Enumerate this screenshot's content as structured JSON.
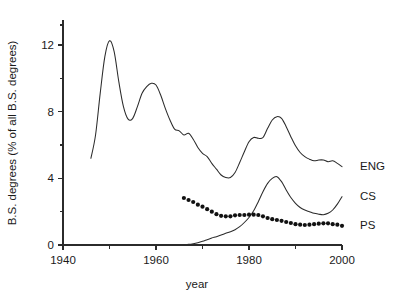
{
  "chart_data": {
    "type": "line",
    "title": "",
    "xlabel": "year",
    "ylabel": "B.S. degrees (% of all B.S. degrees)",
    "xlim": [
      1940,
      2000
    ],
    "ylim": [
      0,
      13.5
    ],
    "grid": false,
    "legend_position": "right-of-axes-inline",
    "x_ticks_major": [
      1940,
      1960,
      1980,
      2000
    ],
    "x_ticks_major_labels": [
      "1940",
      "1960",
      "1980",
      "2000"
    ],
    "x_ticks_minor": [
      1950,
      1970,
      1990
    ],
    "y_ticks_major": [
      0,
      4,
      8,
      12
    ],
    "y_ticks_major_labels": [
      "0",
      "4",
      "8",
      "12"
    ],
    "y_ticks_minor": [
      2,
      6,
      10
    ],
    "series": [
      {
        "name": "ENG",
        "label": "ENG",
        "style": "line",
        "x": [
          1946,
          1947,
          1948,
          1949,
          1950,
          1951,
          1952,
          1953,
          1954,
          1955,
          1956,
          1957,
          1958,
          1959,
          1960,
          1961,
          1962,
          1963,
          1964,
          1965,
          1966,
          1967,
          1968,
          1969,
          1970,
          1971,
          1972,
          1973,
          1974,
          1975,
          1976,
          1977,
          1978,
          1979,
          1980,
          1981,
          1982,
          1983,
          1984,
          1985,
          1986,
          1987,
          1988,
          1989,
          1990,
          1991,
          1992,
          1993,
          1994,
          1995,
          1996,
          1997,
          1998,
          1999,
          2000
        ],
        "y": [
          5.2,
          6.6,
          9.1,
          11.3,
          12.25,
          11.6,
          9.8,
          8.3,
          7.55,
          7.6,
          8.3,
          9.1,
          9.5,
          9.7,
          9.6,
          9.0,
          8.2,
          7.5,
          6.95,
          6.85,
          6.6,
          6.7,
          6.35,
          5.85,
          5.5,
          5.3,
          4.9,
          4.55,
          4.2,
          4.05,
          4.05,
          4.35,
          4.95,
          5.6,
          6.2,
          6.45,
          6.4,
          6.45,
          7.0,
          7.5,
          7.7,
          7.6,
          7.1,
          6.5,
          5.95,
          5.55,
          5.3,
          5.15,
          5.05,
          5.1,
          5.1,
          5.0,
          5.05,
          4.9,
          4.7
        ],
        "notes": "Starts 1946 at ~5.2; peak ~12.2 in 1950; secondary peak ~9.7 in 1959; trough ~4.0 in 1975-76; second peak ~7.7 in 1986; ends ~4.7 in 2000"
      },
      {
        "name": "CS",
        "label": "CS",
        "style": "line",
        "x": [
          1966,
          1967,
          1968,
          1969,
          1970,
          1971,
          1972,
          1973,
          1974,
          1975,
          1976,
          1977,
          1978,
          1979,
          1980,
          1981,
          1982,
          1983,
          1984,
          1985,
          1986,
          1987,
          1988,
          1989,
          1990,
          1991,
          1992,
          1993,
          1994,
          1995,
          1996,
          1997,
          1998,
          1999,
          2000
        ],
        "y": [
          0.02,
          0.04,
          0.08,
          0.14,
          0.22,
          0.32,
          0.42,
          0.5,
          0.6,
          0.7,
          0.8,
          0.92,
          1.1,
          1.35,
          1.65,
          2.05,
          2.6,
          3.2,
          3.7,
          4.0,
          4.1,
          3.8,
          3.3,
          2.85,
          2.5,
          2.25,
          2.1,
          2.0,
          1.9,
          1.85,
          1.82,
          1.9,
          2.1,
          2.45,
          2.9
        ],
        "notes": "Begins near 0 around 1966; slow rise through 1970s; sharp climb to peak ~4.1 in 1986; decline to ~1.8 by 1996; rebound to ~2.9 at 2000"
      },
      {
        "name": "PS",
        "label": "PS",
        "style": "dots",
        "x": [
          1966,
          1967,
          1968,
          1969,
          1970,
          1971,
          1972,
          1973,
          1974,
          1975,
          1976,
          1977,
          1978,
          1979,
          1980,
          1981,
          1982,
          1983,
          1984,
          1985,
          1986,
          1987,
          1988,
          1989,
          1990,
          1991,
          1992,
          1993,
          1994,
          1995,
          1996,
          1997,
          1998,
          1999,
          2000
        ],
        "y": [
          2.82,
          2.7,
          2.58,
          2.42,
          2.3,
          2.15,
          2.0,
          1.85,
          1.75,
          1.72,
          1.72,
          1.78,
          1.8,
          1.8,
          1.82,
          1.82,
          1.8,
          1.72,
          1.62,
          1.55,
          1.5,
          1.45,
          1.38,
          1.32,
          1.25,
          1.22,
          1.2,
          1.22,
          1.25,
          1.28,
          1.3,
          1.3,
          1.25,
          1.22,
          1.15
        ],
        "notes": "Dotted series starting ~2.8 in 1966, declining to a plateau ~1.8 around 1978-1982, then slow decline to ~1.15 by 2000"
      }
    ]
  },
  "colors": {
    "ink": "#2b2b2b",
    "background": "#ffffff",
    "dot": "#111111"
  }
}
